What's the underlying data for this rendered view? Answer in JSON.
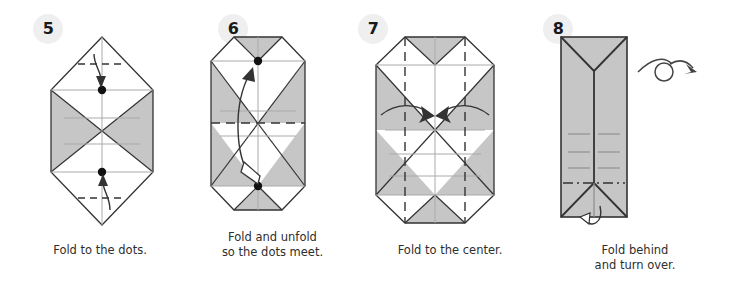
{
  "document": {
    "type": "origami-instructions",
    "background_color": "#ffffff",
    "paper_front_color": "#ffffff",
    "paper_back_color": "#c6c6c6",
    "line_color": "#333333",
    "crease_color": "#999999",
    "text_color": "#2e2e2e",
    "badge_background": "#efefef"
  },
  "steps": [
    {
      "number": "5",
      "caption": "Fold to the dots.",
      "shape": "hexagon",
      "markers": [
        "dot-upper",
        "dot-lower"
      ],
      "arrows": [
        "fold-down-arrow",
        "fold-up-arrow"
      ],
      "crease_style": "valley-dashed"
    },
    {
      "number": "6",
      "caption": "Fold and unfold\nso the dots meet.",
      "shape": "octagon",
      "markers": [
        "dot-top",
        "dot-bottom"
      ],
      "arrows": [
        "fold-and-unfold-arrow"
      ],
      "crease_style": "valley-dashed"
    },
    {
      "number": "7",
      "caption": "Fold to the center.",
      "shape": "octagon",
      "markers": [],
      "arrows": [
        "fold-left-inward-arrow",
        "fold-right-inward-arrow"
      ],
      "crease_style": "valley-dashed-vertical"
    },
    {
      "number": "8",
      "caption": "Fold behind\nand turn over.",
      "shape": "rectangle",
      "markers": [],
      "arrows": [
        "fold-behind-hook-arrow",
        "turn-over-symbol"
      ],
      "crease_style": "dash-dot"
    }
  ]
}
